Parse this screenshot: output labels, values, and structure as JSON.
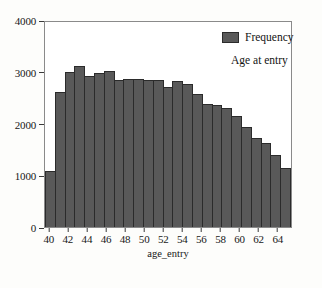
{
  "chart_data": {
    "type": "bar",
    "title": "",
    "subtitle": "",
    "xlabel": "age_entry",
    "ylabel": "",
    "xlim": [
      39.5,
      65.5
    ],
    "ylim": [
      0,
      4000
    ],
    "grid": false,
    "legend_position": "top-right",
    "legend": [
      {
        "name": "Frequency",
        "color": "#595959"
      }
    ],
    "annotations": [
      {
        "text": "Age at entry"
      }
    ],
    "x_ticks": [
      40,
      42,
      44,
      46,
      48,
      50,
      52,
      54,
      56,
      58,
      60,
      62,
      64
    ],
    "y_ticks": [
      0,
      1000,
      2000,
      3000,
      4000
    ],
    "series_name": "Frequency",
    "bar_color": "#595959",
    "bar_edge_color": "#2b2b2b",
    "categories": [
      40,
      41,
      42,
      43,
      44,
      45,
      46,
      47,
      48,
      49,
      50,
      51,
      52,
      53,
      54,
      55,
      56,
      57,
      58,
      59,
      60,
      61,
      62,
      63,
      64
    ],
    "values": [
      1090,
      2630,
      3020,
      3140,
      2950,
      3010,
      3050,
      2870,
      2890,
      2880,
      2870,
      2860,
      2740,
      2850,
      2800,
      2600,
      2400,
      2390,
      2320,
      2170,
      1960,
      1730,
      1640,
      1400,
      1150
    ]
  },
  "axes": {
    "y_axis_name": "frequency-axis",
    "x_axis_name": "age-axis"
  }
}
